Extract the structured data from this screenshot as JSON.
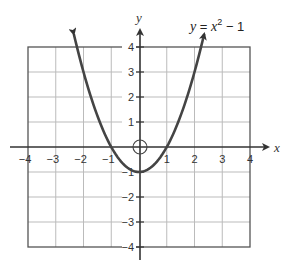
{
  "chart_data": {
    "type": "line",
    "title": "",
    "equation_label": {
      "lhs": "y",
      "eq": " = ",
      "var": "x",
      "exp": "2",
      "rest": " − 1"
    },
    "xlabel": "x",
    "ylabel": "y",
    "xlim": [
      -4,
      4
    ],
    "ylim": [
      -4,
      4
    ],
    "grid": true,
    "x_ticks": [
      -4,
      -3,
      -2,
      -1,
      1,
      2,
      3,
      4
    ],
    "x_tick_labels": [
      "−4",
      "−3",
      "−2",
      "−1",
      "1",
      "2",
      "3",
      "4"
    ],
    "y_ticks": [
      4,
      3,
      2,
      1,
      -1,
      -2,
      -3,
      -4
    ],
    "y_tick_labels": [
      "4",
      "3",
      "2",
      "1",
      "−1",
      "−2",
      "−3",
      "−4"
    ],
    "series": [
      {
        "name": "y = x^2 - 1",
        "function": "x^2 - 1",
        "x": [
          -2.35,
          -2,
          -1.5,
          -1,
          -0.5,
          0,
          0.5,
          1,
          1.5,
          2,
          2.35
        ],
        "y": [
          4.52,
          3,
          1.25,
          0,
          -0.75,
          -1,
          -0.75,
          0,
          1.25,
          3,
          4.52
        ],
        "arrows_both_ends": true,
        "color": "#444444"
      }
    ],
    "annotations": [
      {
        "type": "open-circle",
        "x": 0,
        "y": 0,
        "note": "circle marking origin"
      }
    ]
  }
}
